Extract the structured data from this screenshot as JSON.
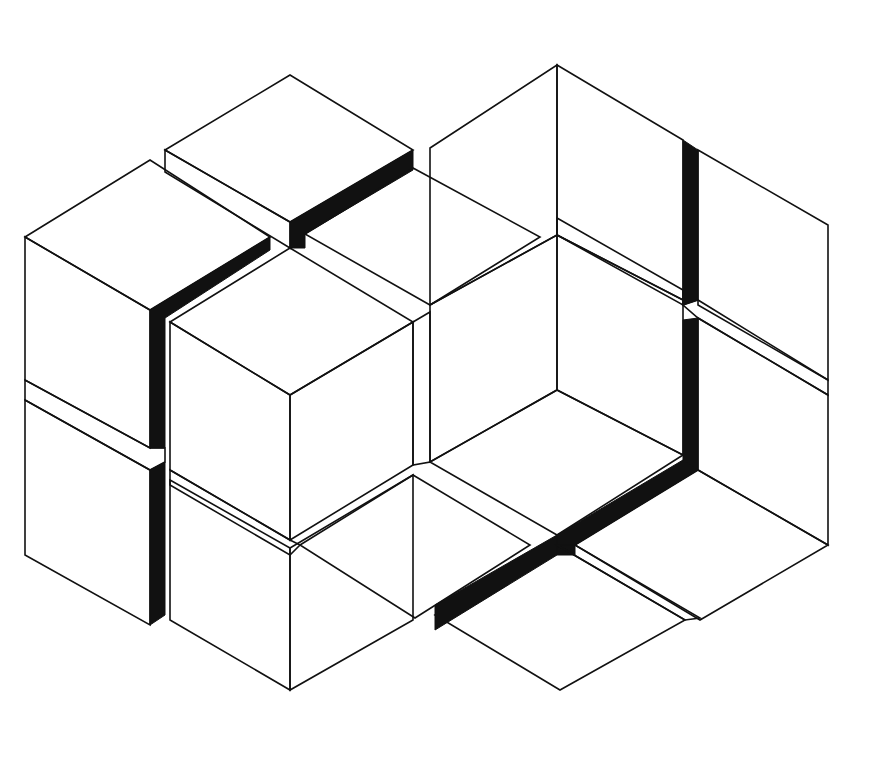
{
  "figure": {
    "style": "stippled line drawing",
    "colors": {
      "ink": "#111111",
      "paper": "#ffffff"
    },
    "dimensions": {
      "width": 895,
      "height": 767
    }
  }
}
